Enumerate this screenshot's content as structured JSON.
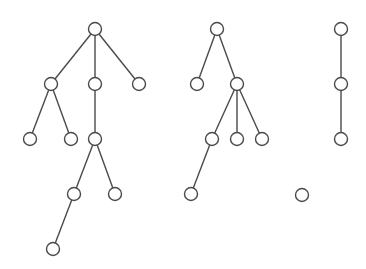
{
  "diagram": {
    "type": "forest",
    "colors": {
      "background": "#ffffff",
      "stroke": "#4a4a4a",
      "node_fill": "#ffffff"
    },
    "node_radius": 6.5,
    "nodes": [
      {
        "id": "a",
        "x": 95,
        "y": 29
      },
      {
        "id": "b",
        "x": 51,
        "y": 84
      },
      {
        "id": "c",
        "x": 95,
        "y": 84
      },
      {
        "id": "d",
        "x": 139,
        "y": 84
      },
      {
        "id": "e",
        "x": 30,
        "y": 139
      },
      {
        "id": "f",
        "x": 71,
        "y": 139
      },
      {
        "id": "g",
        "x": 95,
        "y": 139
      },
      {
        "id": "h",
        "x": 74,
        "y": 194
      },
      {
        "id": "i",
        "x": 115,
        "y": 194
      },
      {
        "id": "j",
        "x": 53,
        "y": 249
      },
      {
        "id": "k",
        "x": 217,
        "y": 29
      },
      {
        "id": "l",
        "x": 197,
        "y": 84
      },
      {
        "id": "m",
        "x": 237,
        "y": 84
      },
      {
        "id": "n",
        "x": 212,
        "y": 139
      },
      {
        "id": "o",
        "x": 237,
        "y": 139
      },
      {
        "id": "p",
        "x": 262,
        "y": 139
      },
      {
        "id": "q",
        "x": 191,
        "y": 194
      },
      {
        "id": "r",
        "x": 341,
        "y": 29
      },
      {
        "id": "s",
        "x": 341,
        "y": 84
      },
      {
        "id": "t",
        "x": 341,
        "y": 139
      },
      {
        "id": "u",
        "x": 302,
        "y": 195
      }
    ],
    "edges": [
      [
        "a",
        "b"
      ],
      [
        "a",
        "c"
      ],
      [
        "a",
        "d"
      ],
      [
        "b",
        "e"
      ],
      [
        "b",
        "f"
      ],
      [
        "c",
        "g"
      ],
      [
        "g",
        "h"
      ],
      [
        "g",
        "i"
      ],
      [
        "h",
        "j"
      ],
      [
        "k",
        "l"
      ],
      [
        "k",
        "m"
      ],
      [
        "m",
        "n"
      ],
      [
        "m",
        "o"
      ],
      [
        "m",
        "p"
      ],
      [
        "n",
        "q"
      ],
      [
        "r",
        "s"
      ],
      [
        "s",
        "t"
      ]
    ]
  }
}
